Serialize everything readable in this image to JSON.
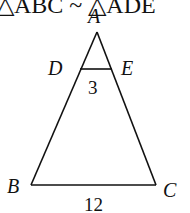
{
  "caption": "△ABC ~ △ADE",
  "vertices": {
    "A": {
      "label": "A",
      "x": 97,
      "y": 32
    },
    "B": {
      "label": "B",
      "x": 31,
      "y": 185
    },
    "C": {
      "label": "C",
      "x": 156,
      "y": 185
    },
    "D": {
      "label": "D",
      "x": 77,
      "y": 69
    },
    "E": {
      "label": "E",
      "x": 111,
      "y": 69
    }
  },
  "segments": {
    "DE": {
      "label": "3"
    },
    "BC": {
      "label": "12"
    }
  },
  "colors": {
    "stroke": "#111111",
    "background": "#ffffff"
  }
}
